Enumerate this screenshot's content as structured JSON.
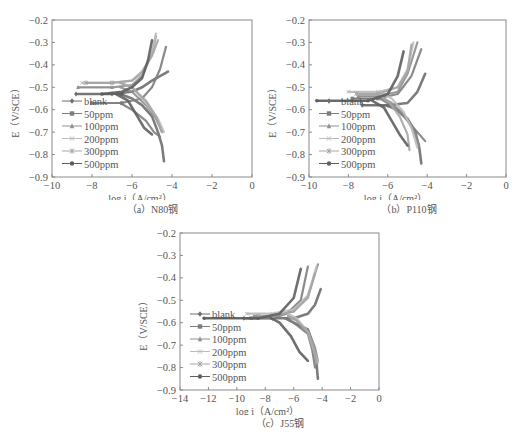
{
  "figure": {
    "series_names": [
      "blank",
      "50ppm",
      "100ppm",
      "200ppm",
      "300ppm",
      "500ppm"
    ],
    "series_markers": [
      "diamond",
      "square",
      "triangle",
      "cross",
      "asterisk",
      "circle"
    ],
    "series_colors": [
      "#6e6e6e",
      "#7d7d7d",
      "#8f8f8f",
      "#bdbdbd",
      "#a5a5a5",
      "#5f5f5f"
    ]
  },
  "chart_data": [
    {
      "type": "line",
      "id": "a",
      "caption": "（a）N80钢",
      "title": "",
      "xlabel": "log i（A/cm²）",
      "ylabel": "E（V/SCE）",
      "xlim": [
        -10,
        0
      ],
      "ylim": [
        -0.9,
        -0.2
      ],
      "xticks": [
        "-10",
        "-8",
        "-6",
        "-4",
        "-2",
        "0"
      ],
      "yticks": [
        "-0.2",
        "-0.3",
        "-0.4",
        "-0.5",
        "-0.6",
        "-0.7",
        "-0.8",
        "-0.9"
      ],
      "grid": false,
      "legend_position": "lower-left",
      "series": [
        {
          "name": "blank",
          "ecorr": -0.53,
          "x": [
            -8.8,
            -7.0,
            -6.0,
            -5.5,
            -5.0,
            -4.6,
            -4.2
          ],
          "anodic_y": [
            -0.53,
            -0.53,
            -0.52,
            -0.5,
            -0.47,
            -0.45,
            -0.43
          ],
          "cathodic_x": [
            -6.0,
            -5.5,
            -5.0,
            -4.7,
            -4.5,
            -4.4
          ],
          "cathodic_y": [
            -0.55,
            -0.58,
            -0.63,
            -0.7,
            -0.76,
            -0.83
          ]
        },
        {
          "name": "50ppm",
          "ecorr": -0.57,
          "x": [
            -8.0,
            -6.5,
            -5.5,
            -5.0,
            -4.6,
            -4.3
          ],
          "anodic_y": [
            -0.57,
            -0.57,
            -0.55,
            -0.5,
            -0.42,
            -0.32
          ],
          "cathodic_x": [
            -6.0,
            -5.3,
            -4.9,
            -4.6
          ],
          "cathodic_y": [
            -0.6,
            -0.65,
            -0.7,
            -0.72
          ]
        },
        {
          "name": "100ppm",
          "ecorr": -0.5,
          "x": [
            -8.7,
            -7.0,
            -6.0,
            -5.5,
            -5.0,
            -4.8
          ],
          "anodic_y": [
            -0.5,
            -0.5,
            -0.49,
            -0.45,
            -0.35,
            -0.27
          ],
          "cathodic_x": [
            -6.0,
            -5.3,
            -4.8,
            -4.5
          ],
          "cathodic_y": [
            -0.52,
            -0.58,
            -0.64,
            -0.7
          ]
        },
        {
          "name": "200ppm",
          "ecorr": -0.48,
          "x": [
            -8.5,
            -7.0,
            -6.0,
            -5.5,
            -5.0,
            -4.8
          ],
          "anodic_y": [
            -0.48,
            -0.48,
            -0.47,
            -0.44,
            -0.35,
            -0.26
          ],
          "cathodic_x": [
            -6.0,
            -5.3,
            -4.7,
            -4.4
          ],
          "cathodic_y": [
            -0.5,
            -0.57,
            -0.64,
            -0.7
          ]
        },
        {
          "name": "300ppm",
          "ecorr": -0.48,
          "x": [
            -8.3,
            -7.0,
            -6.0,
            -5.5,
            -5.0,
            -4.7
          ],
          "anodic_y": [
            -0.48,
            -0.48,
            -0.47,
            -0.43,
            -0.36,
            -0.29
          ],
          "cathodic_x": [
            -6.0,
            -5.3,
            -4.8,
            -4.5
          ],
          "cathodic_y": [
            -0.5,
            -0.56,
            -0.63,
            -0.7
          ]
        },
        {
          "name": "500ppm",
          "ecorr": -0.53,
          "x": [
            -7.5,
            -6.5,
            -6.0,
            -5.5,
            -5.2,
            -5.0
          ],
          "anodic_y": [
            -0.53,
            -0.52,
            -0.5,
            -0.46,
            -0.38,
            -0.29
          ],
          "cathodic_x": [
            -6.2,
            -5.8,
            -5.4,
            -5.0
          ],
          "cathodic_y": [
            -0.56,
            -0.62,
            -0.68,
            -0.71
          ]
        }
      ]
    },
    {
      "type": "line",
      "id": "b",
      "caption": "（b）P110钢",
      "title": "",
      "xlabel": "log i（A/cm²）",
      "ylabel": "E（V/SCE）",
      "xlim": [
        -10,
        0
      ],
      "ylim": [
        -0.9,
        -0.2
      ],
      "xticks": [
        "-10",
        "-8",
        "-6",
        "-4",
        "-2",
        "0"
      ],
      "yticks": [
        "-0.2",
        "-0.3",
        "-0.4",
        "-0.5",
        "-0.6",
        "-0.7",
        "-0.8",
        "-0.9"
      ],
      "grid": false,
      "legend_position": "lower-left",
      "series": [
        {
          "name": "blank",
          "ecorr": -0.58,
          "x": [
            -7.3,
            -6.0,
            -5.0,
            -4.5,
            -4.1
          ],
          "anodic_y": [
            -0.58,
            -0.58,
            -0.57,
            -0.52,
            -0.44
          ],
          "cathodic_x": [
            -5.5,
            -5.0,
            -4.6,
            -4.4,
            -4.3
          ],
          "cathodic_y": [
            -0.6,
            -0.64,
            -0.7,
            -0.77,
            -0.84
          ]
        },
        {
          "name": "50ppm",
          "ecorr": -0.55,
          "x": [
            -7.8,
            -6.5,
            -5.5,
            -4.8,
            -4.3
          ],
          "anodic_y": [
            -0.55,
            -0.55,
            -0.53,
            -0.45,
            -0.33
          ],
          "cathodic_x": [
            -5.8,
            -5.2,
            -4.6,
            -4.1
          ],
          "cathodic_y": [
            -0.58,
            -0.63,
            -0.69,
            -0.74
          ]
        },
        {
          "name": "100ppm",
          "ecorr": -0.54,
          "x": [
            -7.5,
            -6.5,
            -5.5,
            -5.0,
            -4.5
          ],
          "anodic_y": [
            -0.54,
            -0.54,
            -0.52,
            -0.44,
            -0.3
          ],
          "cathodic_x": [
            -5.8,
            -5.2,
            -4.7,
            -4.4
          ],
          "cathodic_y": [
            -0.57,
            -0.62,
            -0.69,
            -0.76
          ]
        },
        {
          "name": "200ppm",
          "ecorr": -0.52,
          "x": [
            -8.0,
            -6.5,
            -5.5,
            -5.0,
            -4.7
          ],
          "anodic_y": [
            -0.52,
            -0.52,
            -0.5,
            -0.42,
            -0.3
          ],
          "cathodic_x": [
            -5.8,
            -5.2,
            -4.8,
            -4.5
          ],
          "cathodic_y": [
            -0.55,
            -0.61,
            -0.68,
            -0.77
          ]
        },
        {
          "name": "300ppm",
          "ecorr": -0.53,
          "x": [
            -7.6,
            -6.5,
            -5.5,
            -5.0,
            -4.8
          ],
          "anodic_y": [
            -0.53,
            -0.53,
            -0.5,
            -0.43,
            -0.31
          ],
          "cathodic_x": [
            -5.9,
            -5.4,
            -5.0,
            -4.9
          ],
          "cathodic_y": [
            -0.57,
            -0.63,
            -0.71,
            -0.78
          ]
        },
        {
          "name": "500ppm",
          "ecorr": -0.56,
          "x": [
            -9.6,
            -7.0,
            -6.0,
            -5.5,
            -5.2
          ],
          "anodic_y": [
            -0.56,
            -0.56,
            -0.53,
            -0.45,
            -0.34
          ],
          "cathodic_x": [
            -6.2,
            -5.8,
            -5.4,
            -5.0
          ],
          "cathodic_y": [
            -0.59,
            -0.65,
            -0.71,
            -0.76
          ]
        }
      ]
    },
    {
      "type": "line",
      "id": "c",
      "caption": "（c）J55钢",
      "title": "",
      "xlabel": "log i（A/cm²）",
      "ylabel": "E（V/SCE）",
      "xlim": [
        -14,
        0
      ],
      "ylim": [
        -0.9,
        -0.2
      ],
      "xticks": [
        "-14",
        "-12",
        "-10",
        "-8",
        "-6",
        "-4",
        "-2",
        "0"
      ],
      "yticks": [
        "-0.2",
        "-0.3",
        "-0.4",
        "-0.5",
        "-0.6",
        "-0.7",
        "-0.8",
        "-0.9"
      ],
      "grid": false,
      "legend_position": "lower-left",
      "series": [
        {
          "name": "blank",
          "ecorr": -0.58,
          "x": [
            -9.5,
            -7.5,
            -6.0,
            -5.0,
            -4.5,
            -4.1
          ],
          "anodic_y": [
            -0.58,
            -0.58,
            -0.58,
            -0.56,
            -0.52,
            -0.45
          ],
          "cathodic_x": [
            -6.0,
            -5.0,
            -4.6,
            -4.4,
            -4.3
          ],
          "cathodic_y": [
            -0.6,
            -0.63,
            -0.7,
            -0.78,
            -0.85
          ]
        },
        {
          "name": "50ppm",
          "ecorr": -0.58,
          "x": [
            -9.0,
            -7.5,
            -6.5,
            -5.5,
            -5.0
          ],
          "anodic_y": [
            -0.58,
            -0.58,
            -0.56,
            -0.5,
            -0.35
          ],
          "cathodic_x": [
            -6.0,
            -5.0,
            -4.7,
            -4.5
          ],
          "cathodic_y": [
            -0.6,
            -0.65,
            -0.72,
            -0.8
          ]
        },
        {
          "name": "100ppm",
          "ecorr": -0.57,
          "x": [
            -8.8,
            -7.5,
            -6.0,
            -5.0,
            -4.3
          ],
          "anodic_y": [
            -0.57,
            -0.57,
            -0.55,
            -0.48,
            -0.34
          ],
          "cathodic_x": [
            -5.8,
            -5.0,
            -4.5,
            -4.3
          ],
          "cathodic_y": [
            -0.59,
            -0.64,
            -0.71,
            -0.77
          ]
        },
        {
          "name": "200ppm",
          "ecorr": -0.56,
          "x": [
            -9.3,
            -7.5,
            -6.0,
            -5.0,
            -4.4
          ],
          "anodic_y": [
            -0.56,
            -0.56,
            -0.54,
            -0.48,
            -0.35
          ],
          "cathodic_x": [
            -5.8,
            -5.0,
            -4.6,
            -4.3
          ],
          "cathodic_y": [
            -0.58,
            -0.64,
            -0.72,
            -0.78
          ]
        },
        {
          "name": "300ppm",
          "ecorr": -0.57,
          "x": [
            -8.5,
            -7.5,
            -6.0,
            -5.0,
            -4.5
          ],
          "anodic_y": [
            -0.57,
            -0.57,
            -0.55,
            -0.49,
            -0.38
          ],
          "cathodic_x": [
            -5.8,
            -5.0,
            -4.6,
            -4.4
          ],
          "cathodic_y": [
            -0.59,
            -0.64,
            -0.71,
            -0.78
          ]
        },
        {
          "name": "500ppm",
          "ecorr": -0.58,
          "x": [
            -12.3,
            -8.5,
            -7.0,
            -6.0,
            -5.5
          ],
          "anodic_y": [
            -0.58,
            -0.58,
            -0.56,
            -0.49,
            -0.36
          ],
          "cathodic_x": [
            -7.0,
            -6.2,
            -5.6,
            -5.0
          ],
          "cathodic_y": [
            -0.6,
            -0.66,
            -0.73,
            -0.77
          ]
        }
      ]
    }
  ]
}
